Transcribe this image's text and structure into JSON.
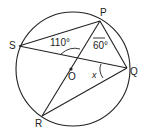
{
  "diagram": {
    "type": "circle-geometry",
    "colors": {
      "stroke": "#222222",
      "background": "#ffffff"
    },
    "points": {
      "P": {
        "label": "P",
        "x": 100,
        "y": 21
      },
      "S": {
        "label": "S",
        "x": 19,
        "y": 46
      },
      "Q": {
        "label": "Q",
        "x": 127,
        "y": 68
      },
      "R": {
        "label": "R",
        "x": 42,
        "y": 116
      },
      "O": {
        "label": "O",
        "x": 71,
        "y": 71
      }
    },
    "angles": {
      "angle_110": {
        "label": "110°"
      },
      "angle_60": {
        "label": "60°"
      },
      "angle_x": {
        "label": "x"
      }
    }
  }
}
